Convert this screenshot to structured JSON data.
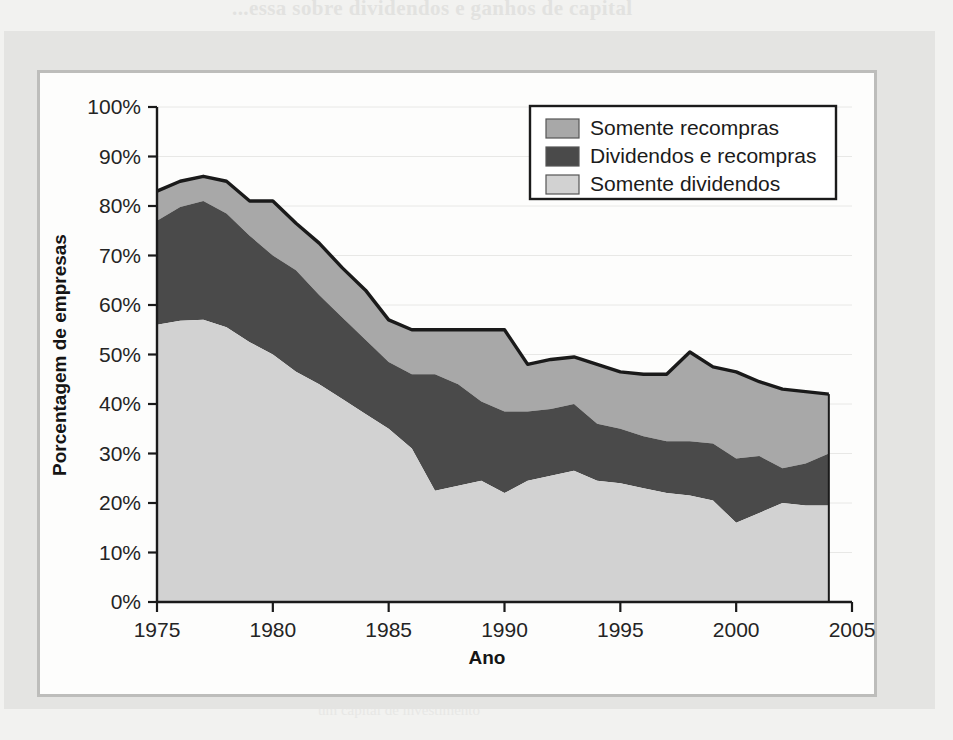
{
  "figure": {
    "background_color": "#f2f2f0",
    "panel_color": "#e4e4e2",
    "plate_color": "#fdfdfc",
    "plate_border_color": "#bdbdbb"
  },
  "bleed_through": {
    "line_top": "...essa sobre dividendos e ganhos de capital",
    "line_right_1": "Os acionistas normalmente tem um imposto maior",
    "line_right_2": "sobre pagamentos de dividendos que sobre",
    "line_bottom": "um capital de investimento"
  },
  "legend": {
    "position": "top-right",
    "border_color": "#1b1b1b",
    "background": "#ffffff",
    "items": [
      {
        "label": "Somente recompras",
        "color": "#a8a8a8"
      },
      {
        "label": "Dividendos e recompras",
        "color": "#4a4a4a"
      },
      {
        "label": "Somente dividendos",
        "color": "#d2d2d2"
      }
    ]
  },
  "chart_data": {
    "type": "area",
    "stacked": true,
    "title": "",
    "subtitle": "",
    "xlabel": "Ano",
    "ylabel": "Porcentagem de empresas",
    "xlim": [
      1975,
      2005
    ],
    "ylim": [
      0,
      100
    ],
    "xticks": [
      1975,
      1980,
      1985,
      1990,
      1995,
      2000,
      2005
    ],
    "xtick_labels": [
      "1975",
      "1980",
      "1985",
      "1990",
      "1995",
      "2000",
      "2005"
    ],
    "yticks": [
      0,
      10,
      20,
      30,
      40,
      50,
      60,
      70,
      80,
      90,
      100
    ],
    "ytick_labels": [
      "0%",
      "10%",
      "20%",
      "30%",
      "40%",
      "50%",
      "60%",
      "70%",
      "80%",
      "90%",
      "100%"
    ],
    "grid": "horizontal-faint",
    "legend_position": "upper right",
    "x": [
      1975,
      1976,
      1977,
      1978,
      1979,
      1980,
      1981,
      1982,
      1983,
      1984,
      1985,
      1986,
      1987,
      1988,
      1989,
      1990,
      1991,
      1992,
      1993,
      1994,
      1995,
      1996,
      1997,
      1998,
      1999,
      2000,
      2001,
      2002,
      2003,
      2004
    ],
    "series": [
      {
        "name": "Somente dividendos",
        "color": "#d2d2d2",
        "stack_order": 1,
        "values": [
          56.0,
          56.8,
          57.0,
          55.5,
          52.5,
          50.0,
          46.5,
          44.0,
          41.0,
          38.0,
          35.0,
          31.0,
          22.5,
          23.5,
          24.5,
          22.0,
          24.5,
          25.5,
          26.5,
          24.5,
          24.0,
          23.0,
          22.0,
          21.5,
          20.5,
          16.0,
          18.0,
          20.0,
          19.5,
          19.5
        ]
      },
      {
        "name": "Dividendos e recompras",
        "color": "#4a4a4a",
        "stack_order": 2,
        "values": [
          21.0,
          23.0,
          24.0,
          23.0,
          21.5,
          20.0,
          20.5,
          18.0,
          16.5,
          15.0,
          13.5,
          15.0,
          23.5,
          20.5,
          16.0,
          16.5,
          14.0,
          13.5,
          13.5,
          11.5,
          11.0,
          10.5,
          10.5,
          11.0,
          11.5,
          13.0,
          11.5,
          7.0,
          8.5,
          10.5
        ]
      },
      {
        "name": "Somente recompras",
        "color": "#a8a8a8",
        "stack_order": 3,
        "values": [
          6.0,
          5.2,
          5.0,
          6.5,
          7.0,
          11.0,
          9.5,
          10.5,
          10.0,
          10.0,
          8.5,
          9.0,
          9.0,
          11.0,
          14.5,
          16.5,
          9.5,
          10.0,
          9.5,
          12.0,
          11.5,
          12.5,
          13.5,
          18.0,
          15.5,
          17.5,
          15.0,
          16.0,
          14.5,
          12.0
        ]
      }
    ],
    "totals": [
      83.0,
      85.0,
      86.0,
      85.0,
      81.0,
      81.0,
      76.5,
      72.5,
      67.5,
      63.0,
      57.0,
      55.0,
      55.0,
      55.0,
      55.0,
      55.0,
      48.0,
      49.0,
      49.5,
      48.0,
      46.5,
      46.0,
      46.0,
      50.5,
      47.5,
      46.5,
      44.5,
      43.0,
      42.5,
      42.0
    ]
  }
}
